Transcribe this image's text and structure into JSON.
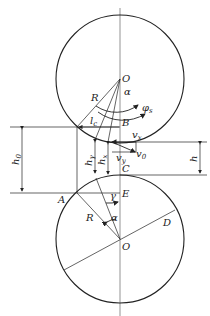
{
  "diagram": {
    "type": "rolling geometry (two rolls)",
    "top_roll": {
      "center_label": "O",
      "radius_label": "R"
    },
    "bottom_roll": {
      "center_label": "O",
      "radius_label": "R"
    },
    "labels": {
      "O_top": "O",
      "alpha_top": "α",
      "phi": "φ",
      "phi_sub": "s",
      "R_top": "R",
      "B": "B",
      "lc": "l",
      "lc_sub": "c",
      "vx": "v",
      "vx_sub": "x",
      "vy": "v",
      "vy_sub": "y",
      "v0": "v",
      "v0_sub": "0",
      "h0": "h",
      "h0_sub": "0",
      "hgamma": "h",
      "hgamma_sub": "γ",
      "hx": "h",
      "hx_sub": "x",
      "h": "h",
      "C": "C",
      "A": "A",
      "E": "E",
      "gamma": "γ",
      "R_bottom": "R",
      "alpha_bottom": "α",
      "D": "D",
      "O_bottom": "O"
    },
    "colors": {
      "line": "#222222",
      "axis": "#555555",
      "background": "#ffffff"
    }
  }
}
